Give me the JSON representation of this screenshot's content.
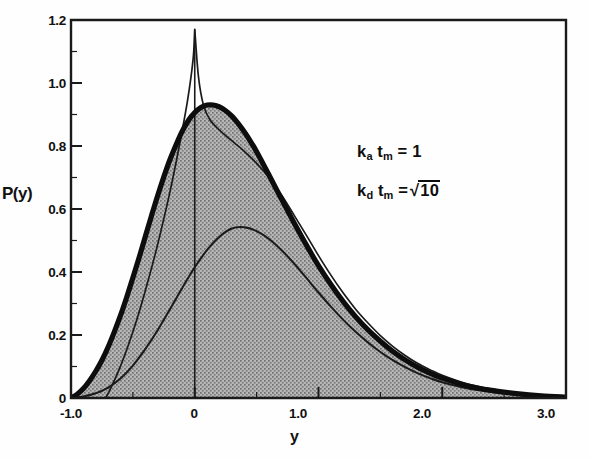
{
  "figure": {
    "background_color": "#fefefe",
    "ink_color": "#111111",
    "fill_color": "#9a9a9a"
  },
  "axes": {
    "y_label": "P(y)",
    "x_label": "y",
    "y_ticks": [
      "1.2",
      "1.0",
      "0.8",
      "0.6",
      "0.4",
      "0.2",
      "0"
    ],
    "y_tick_values": [
      1.2,
      1.0,
      0.8,
      0.6,
      0.4,
      0.2,
      0
    ],
    "x_ticks": [
      "-1.0",
      "0",
      "1.0",
      "2.0",
      "3.0"
    ],
    "x_tick_values": [
      -1.0,
      0,
      1.0,
      2.0,
      3.0
    ]
  },
  "annotations": {
    "line1_base": "k",
    "line1_sub1": "a",
    "line1_mid": " t",
    "line1_sub2": "m",
    "line1_tail": " = 1",
    "line2_base": "k",
    "line2_sub1": "d",
    "line2_mid": " t",
    "line2_sub2": "m",
    "line2_eq": " =",
    "line2_radicand": "10",
    "line1_plain": "k_a t_m = 1",
    "line2_plain": "k_d t_m = √10"
  },
  "chart_data": {
    "type": "line",
    "title": "",
    "subtitle": "",
    "xlabel": "y",
    "ylabel": "P(y)",
    "xlim": [
      -1.0,
      3.0
    ],
    "ylim": [
      0,
      1.2
    ],
    "grid": false,
    "legend_position": "none",
    "fill_between": {
      "series": "total-distribution",
      "baseline": 0,
      "pattern": "gray-stipple",
      "color": "#9a9a9a"
    },
    "annotations": [
      "k_a t_m = 1",
      "k_d t_m = √10"
    ],
    "series": [
      {
        "name": "total-distribution",
        "style": "thick-solid",
        "linewidth": 5.2,
        "peak_x": 0.12,
        "peak_y": 0.93,
        "x": [
          -1.0,
          -0.95,
          -0.9,
          -0.85,
          -0.8,
          -0.75,
          -0.7,
          -0.65,
          -0.6,
          -0.55,
          -0.5,
          -0.45,
          -0.4,
          -0.35,
          -0.3,
          -0.25,
          -0.2,
          -0.15,
          -0.1,
          -0.05,
          0.0,
          0.05,
          0.1,
          0.15,
          0.2,
          0.25,
          0.3,
          0.35,
          0.4,
          0.45,
          0.5,
          0.6,
          0.7,
          0.8,
          0.9,
          1.0,
          1.1,
          1.2,
          1.3,
          1.4,
          1.5,
          1.6,
          1.7,
          1.8,
          1.9,
          2.0,
          2.2,
          2.4,
          2.6,
          2.8,
          3.0
        ],
        "y": [
          0.0,
          0.012,
          0.03,
          0.055,
          0.085,
          0.12,
          0.162,
          0.21,
          0.262,
          0.32,
          0.382,
          0.445,
          0.512,
          0.578,
          0.642,
          0.702,
          0.757,
          0.805,
          0.848,
          0.882,
          0.906,
          0.922,
          0.93,
          0.93,
          0.924,
          0.912,
          0.895,
          0.872,
          0.845,
          0.815,
          0.782,
          0.708,
          0.632,
          0.558,
          0.487,
          0.42,
          0.36,
          0.306,
          0.258,
          0.216,
          0.18,
          0.148,
          0.121,
          0.098,
          0.079,
          0.063,
          0.039,
          0.024,
          0.014,
          0.007,
          0.003
        ]
      },
      {
        "name": "sharp-peak-component",
        "style": "thin-solid",
        "linewidth": 1.7,
        "peak_x": 0.0,
        "peak_y": 1.17,
        "x": [
          -0.72,
          -0.68,
          -0.62,
          -0.56,
          -0.5,
          -0.44,
          -0.38,
          -0.32,
          -0.26,
          -0.2,
          -0.15,
          -0.1,
          -0.06,
          -0.03,
          -0.01,
          0.0,
          0.03,
          0.07,
          0.12,
          0.18,
          0.25,
          0.32,
          0.4,
          0.5,
          0.6,
          0.7,
          0.8,
          0.9,
          1.0,
          1.1,
          1.2,
          1.3,
          1.4,
          1.5,
          1.6,
          1.7,
          1.8,
          1.9,
          2.0,
          2.2,
          2.4,
          2.6,
          2.8,
          3.0
        ],
        "y": [
          0.0,
          0.03,
          0.082,
          0.142,
          0.21,
          0.285,
          0.368,
          0.456,
          0.552,
          0.655,
          0.75,
          0.852,
          0.94,
          1.02,
          1.09,
          1.17,
          1.02,
          0.93,
          0.885,
          0.858,
          0.833,
          0.81,
          0.783,
          0.745,
          0.7,
          0.645,
          0.582,
          0.518,
          0.452,
          0.39,
          0.333,
          0.282,
          0.238,
          0.198,
          0.164,
          0.135,
          0.11,
          0.09,
          0.072,
          0.045,
          0.028,
          0.016,
          0.008,
          0.003
        ]
      },
      {
        "name": "lower-component",
        "style": "thin-solid",
        "linewidth": 2.0,
        "peak_x": 0.3,
        "peak_y": 0.54,
        "x": [
          -1.0,
          -0.9,
          -0.8,
          -0.7,
          -0.6,
          -0.5,
          -0.4,
          -0.3,
          -0.2,
          -0.1,
          0.0,
          0.1,
          0.2,
          0.3,
          0.4,
          0.5,
          0.6,
          0.7,
          0.8,
          0.9,
          1.0,
          1.1,
          1.2,
          1.3,
          1.4,
          1.5,
          1.6,
          1.7,
          1.8,
          1.9,
          2.0,
          2.2,
          2.4,
          2.6,
          2.8,
          3.0
        ],
        "y": [
          0.0,
          0.005,
          0.015,
          0.033,
          0.062,
          0.103,
          0.155,
          0.215,
          0.282,
          0.35,
          0.415,
          0.47,
          0.512,
          0.538,
          0.542,
          0.53,
          0.505,
          0.47,
          0.428,
          0.382,
          0.335,
          0.29,
          0.248,
          0.21,
          0.176,
          0.146,
          0.12,
          0.098,
          0.079,
          0.063,
          0.05,
          0.031,
          0.019,
          0.011,
          0.006,
          0.002
        ]
      },
      {
        "name": "vertical-marker-at-zero",
        "style": "thin-vertical",
        "x": [
          0.0,
          0.0
        ],
        "y": [
          0.0,
          1.17
        ]
      }
    ]
  }
}
